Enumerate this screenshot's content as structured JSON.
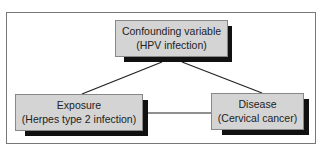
{
  "diagram": {
    "nodes": {
      "confounder": {
        "line1": "Confounding variable",
        "line2": "(HPV infection)"
      },
      "exposure": {
        "line1": "Exposure",
        "line2": "(Herpes type 2 infection)"
      },
      "disease": {
        "line1": "Disease",
        "line2": "(Cervical cancer)"
      }
    },
    "edges": [
      {
        "from": "confounder",
        "to": "exposure"
      },
      {
        "from": "confounder",
        "to": "disease"
      },
      {
        "from": "exposure",
        "to": "disease"
      }
    ],
    "colors": {
      "box_fill": "#d4d4d4",
      "shadow": "#111111",
      "line": "#222222",
      "frame": "#777777"
    }
  }
}
